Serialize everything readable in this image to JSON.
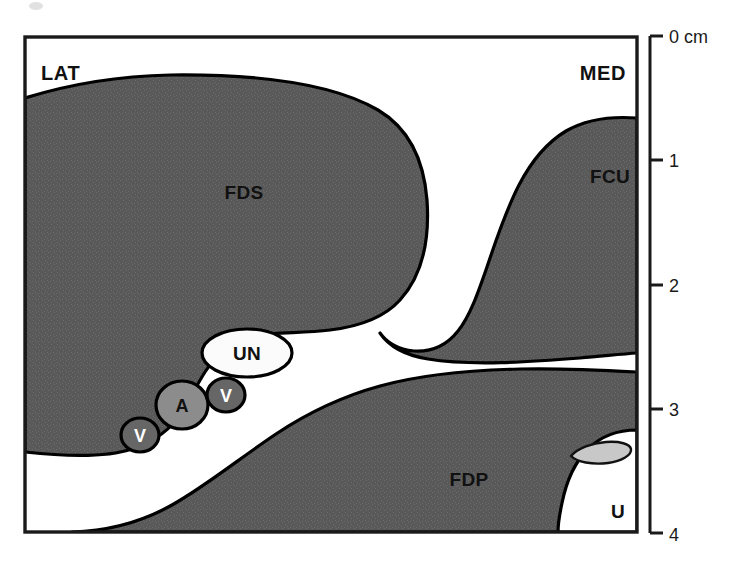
{
  "figure": {
    "type": "anatomical-cross-section",
    "background_color": "#ffffff",
    "muscle_fill_color": "#595959",
    "outline_color": "#000000",
    "artery_fill_color": "#8c8c8c",
    "vein_fill_color": "#666666",
    "nerve_fill_color": "#fbfbfb",
    "bone_fill_color": "#c8c8c8"
  },
  "orientation": {
    "lateral_label": "LAT",
    "medial_label": "MED"
  },
  "structures": [
    {
      "key": "fds",
      "label": "FDS",
      "label_x": 222,
      "label_y": 199,
      "kind": "muscle"
    },
    {
      "key": "fcu",
      "label": "FCU",
      "label_x": 589,
      "label_y": 183,
      "kind": "muscle"
    },
    {
      "key": "fdp",
      "label": "FDP",
      "label_x": 447,
      "label_y": 486,
      "kind": "muscle"
    },
    {
      "key": "un",
      "label": "UN",
      "label_x": 247,
      "label_y": 360,
      "kind": "nerve"
    },
    {
      "key": "a",
      "label": "A",
      "label_x": 182,
      "label_y": 412,
      "kind": "artery"
    },
    {
      "key": "v1",
      "label": "V",
      "label_x": 226,
      "label_y": 402,
      "kind": "vein"
    },
    {
      "key": "v2",
      "label": "V",
      "label_x": 140,
      "label_y": 442,
      "kind": "vein"
    },
    {
      "key": "u",
      "label": "U",
      "label_x": 612,
      "label_y": 518,
      "kind": "bone-space"
    }
  ],
  "ruler": {
    "unit_label": "0 cm",
    "ticks": [
      {
        "label": "0 cm",
        "value": 0,
        "y": 36
      },
      {
        "label": "1",
        "value": 1,
        "y": 160
      },
      {
        "label": "2",
        "value": 2,
        "y": 285
      },
      {
        "label": "3",
        "value": 3,
        "y": 409
      },
      {
        "label": "4",
        "value": 4,
        "y": 533
      }
    ],
    "axis_x": 650,
    "tick_length": 13,
    "range_cm": [
      0,
      4
    ]
  },
  "frame": {
    "left": 24,
    "top": 36,
    "right": 638,
    "bottom": 533
  }
}
